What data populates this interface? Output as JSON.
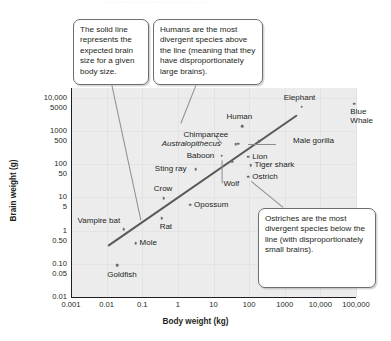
{
  "top_sliver": "·· ··· ···· ·· ···· ·· ·· ···· ···· ···· ··· ·· ·· ···",
  "axes": {
    "x_title": "Body weight (kg)",
    "y_title": "Brain weight (g)",
    "x_ticks": [
      "0.001",
      "0.01",
      "0.1",
      "1",
      "10",
      "100",
      "1000",
      "10,000",
      "100,000"
    ],
    "y_ticks": [
      "10,000",
      "5000",
      "1000",
      "500",
      "100",
      "50",
      "10",
      "5",
      "1",
      "0.50",
      "0.10",
      "0.05",
      "0.01"
    ]
  },
  "callouts": {
    "solid_line": "The solid line represents the expected brain size for a given body size.",
    "humans": "Humans are the most divergent species above the line (meaning that they have disproportionately large brains).",
    "ostriches": "Ostriches are the most divergent species below the line (with disproportionately small brains)."
  },
  "chart_data": {
    "type": "scatter",
    "title": "",
    "xlabel": "Body weight (kg)",
    "ylabel": "Brain weight (g)",
    "xscale": "log",
    "yscale": "log",
    "xlim": [
      0.001,
      100000
    ],
    "ylim": [
      0.01,
      20000
    ],
    "grid": true,
    "legend": "none",
    "trendline": {
      "label": "expected brain size for a given body size",
      "x_start": 0.011,
      "y_start": 0.38,
      "x_end": 2300,
      "y_end": 3400
    },
    "points": [
      {
        "label": "Goldfish",
        "x": 0.02,
        "y": 0.09,
        "label_pos": "below"
      },
      {
        "label": "Mole",
        "x": 0.065,
        "y": 0.42,
        "label_pos": "right"
      },
      {
        "label": "Vampire bat",
        "x": 0.03,
        "y": 1.1,
        "label_pos": "above-left"
      },
      {
        "label": "Rat",
        "x": 0.35,
        "y": 2.4,
        "label_pos": "below"
      },
      {
        "label": "Crow",
        "x": 0.4,
        "y": 9.5,
        "label_pos": "above"
      },
      {
        "label": "Opossum",
        "x": 2.2,
        "y": 6.0,
        "label_pos": "right"
      },
      {
        "label": "Sting ray",
        "x": 3.2,
        "y": 70,
        "label_pos": "left"
      },
      {
        "label": "Wolf",
        "x": 34,
        "y": 120,
        "label_pos": "below"
      },
      {
        "label": "Ostrich",
        "x": 95,
        "y": 42,
        "label_pos": "right"
      },
      {
        "label": "Tiger shark",
        "x": 110,
        "y": 95,
        "label_pos": "right"
      },
      {
        "label": "Lion",
        "x": 95,
        "y": 170,
        "label_pos": "right"
      },
      {
        "label": "Baboon",
        "x": 17,
        "y": 180,
        "label_pos": "left"
      },
      {
        "label": "Australopithecus",
        "x": 42,
        "y": 400,
        "label_pos": "left"
      },
      {
        "label": "Chimpanzee",
        "x": 50,
        "y": 420,
        "label_pos": "above-left"
      },
      {
        "label": "Male gorilla",
        "x": 190,
        "y": 500,
        "label_pos": "right"
      },
      {
        "label": "Human",
        "x": 65,
        "y": 1400,
        "label_pos": "above"
      },
      {
        "label": "Elephant",
        "x": 3000,
        "y": 5500,
        "label_pos": "above"
      },
      {
        "label": "Blue Whale",
        "x": 90000,
        "y": 6800,
        "label_pos": "right"
      }
    ]
  }
}
